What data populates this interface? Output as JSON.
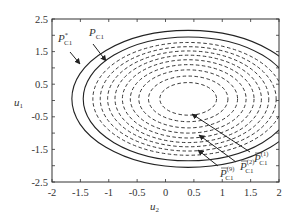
{
  "chart_data": {
    "type": "line",
    "title": "",
    "xlabel": "u2",
    "ylabel": "u1",
    "xlim": [
      -2,
      2
    ],
    "ylim": [
      -2.5,
      2.5
    ],
    "grid": false,
    "xticks": [
      "-2",
      "-1.5",
      "-1",
      "-0.5",
      "0",
      "0.5",
      "1",
      "1.5",
      "2"
    ],
    "yticks": [
      "2.5",
      "1.5",
      "0.5",
      "-0.5",
      "-1.5",
      "-2.5"
    ],
    "center": [
      0.4,
      0.05
    ],
    "series": [
      {
        "name": "P*_C1",
        "style": "solid",
        "rx": 2.05,
        "ry": 2.1
      },
      {
        "name": "P_C1",
        "style": "solid",
        "rx": 1.85,
        "ry": 1.9
      },
      {
        "name": "P̄_C1^(9)",
        "style": "dashed",
        "rx": 1.68,
        "ry": 1.73
      },
      {
        "name": "dashed-8",
        "style": "dashed",
        "rx": 1.55,
        "ry": 1.6
      },
      {
        "name": "dashed-7",
        "style": "dashed",
        "rx": 1.42,
        "ry": 1.47
      },
      {
        "name": "dashed-6",
        "style": "dashed",
        "rx": 1.29,
        "ry": 1.34
      },
      {
        "name": "dashed-5",
        "style": "dashed",
        "rx": 1.16,
        "ry": 1.2
      },
      {
        "name": "dashed-4",
        "style": "dashed",
        "rx": 1.02,
        "ry": 1.05
      },
      {
        "name": "dashed-3",
        "style": "dashed",
        "rx": 0.87,
        "ry": 0.89
      },
      {
        "name": "P̄_C1^(2)",
        "style": "dashed",
        "rx": 0.7,
        "ry": 0.7
      },
      {
        "name": "P̄_C1^(1)",
        "style": "dashed",
        "rx": 0.5,
        "ry": 0.5
      }
    ],
    "annotations": [
      {
        "text": "P*_C1",
        "points_to": "outer solid ellipse"
      },
      {
        "text": "P_C1",
        "points_to": "inner solid ellipse"
      },
      {
        "text": "P̄_C1^(1)",
        "points_to": "innermost dashed ellipse"
      },
      {
        "text": "P̄_C1^(2)",
        "points_to": "second dashed ellipse"
      },
      {
        "text": "P̄_C1^(9)",
        "points_to": "outermost dashed ellipse"
      }
    ]
  },
  "labels": {
    "xlabel_main": "u",
    "xlabel_sub": "2",
    "ylabel_main": "u",
    "ylabel_sub": "1",
    "pstar_main": "P",
    "pstar_sup": "*",
    "pstar_sub": "C1",
    "p_main": "P",
    "p_sub": "C1",
    "pbar1_main": "P",
    "pbar1_sup": "(1)",
    "pbar1_sub": "C1",
    "pbar2_main": "P",
    "pbar2_sup": "(2)",
    "pbar2_sub": "C1",
    "pbar9_main": "P",
    "pbar9_sup": "(9)",
    "pbar9_sub": "C1"
  }
}
